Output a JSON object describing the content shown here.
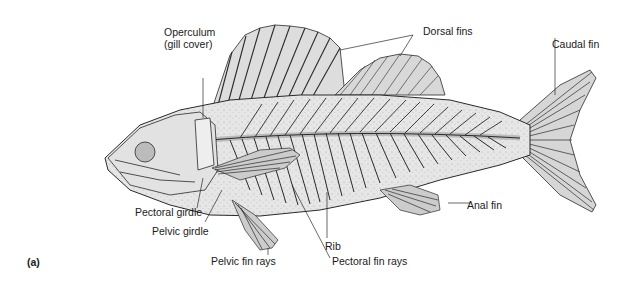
{
  "figure": {
    "panel_label": "(a)",
    "colors": {
      "body_fill": "#e6e6e6",
      "outline": "#2a2a2a",
      "label_text": "#1a1a1a",
      "background": "#ffffff"
    }
  },
  "labels": {
    "operculum_line1": "Operculum",
    "operculum_line2": "(gill cover)",
    "dorsal_fins": "Dorsal fins",
    "caudal_fin": "Caudal fin",
    "anal_fin": "Anal fin",
    "pectoral_girdle": "Pectoral girdle",
    "pelvic_girdle": "Pelvic girdle",
    "pelvic_fin_rays": "Pelvic fin rays",
    "rib": "Rib",
    "pectoral_fin_rays": "Pectoral fin rays"
  }
}
